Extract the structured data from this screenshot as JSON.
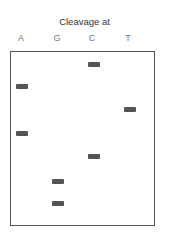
{
  "title": "Cleavage at",
  "lanes": [
    {
      "label": "A",
      "center_x": 21
    },
    {
      "label": "G",
      "center_x": 57
    },
    {
      "label": "C",
      "center_x": 92
    },
    {
      "label": "T",
      "center_x": 128
    }
  ],
  "bands": [
    {
      "lane": "C",
      "order": 1
    },
    {
      "lane": "A",
      "order": 2
    },
    {
      "lane": "T",
      "order": 3
    },
    {
      "lane": "A",
      "order": 4
    },
    {
      "lane": "C",
      "order": 5
    },
    {
      "lane": "G",
      "order": 6
    },
    {
      "lane": "G",
      "order": 7
    }
  ],
  "colors": {
    "band": "#555555",
    "border": "#555555",
    "label": "#777777"
  }
}
